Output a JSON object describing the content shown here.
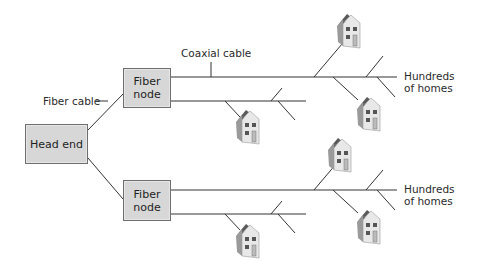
{
  "diagram": {
    "nodes": {
      "head_end": {
        "label": "Head end"
      },
      "fiber_node_top": {
        "label_line1": "Fiber",
        "label_line2": "node"
      },
      "fiber_node_bottom": {
        "label_line1": "Fiber",
        "label_line2": "node"
      }
    },
    "labels": {
      "fiber_cable": "Fiber cable",
      "coaxial_cable": "Coaxial cable",
      "homes_top_line1": "Hundreds",
      "homes_top_line2": "of homes",
      "homes_bottom_line1": "Hundreds",
      "homes_bottom_line2": "of homes"
    },
    "icons": {
      "house": "house-icon",
      "count": 8
    },
    "colors": {
      "box_fill": "#d7d7d7",
      "box_border": "#6e6e6e",
      "line": "#333333",
      "house_wall": "#e6e6e6",
      "house_roof": "#555555"
    }
  }
}
